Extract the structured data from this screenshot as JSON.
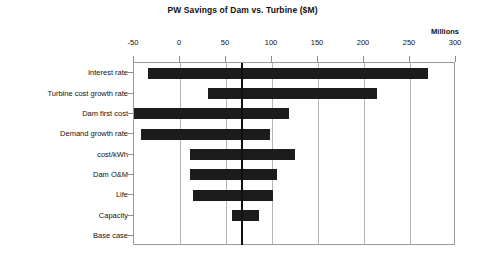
{
  "chart": {
    "title": "PW Savings of Dam vs. Turbine  ($M)",
    "units_label": "Millions"
  },
  "chart_data": {
    "type": "bar",
    "subtype": "tornado",
    "orientation": "horizontal",
    "title": "PW Savings of Dam vs. Turbine  ($M)",
    "xlabel": "Millions",
    "ylabel": "",
    "xlim": [
      -50,
      300
    ],
    "xticks": [
      -50,
      0,
      50,
      100,
      150,
      200,
      250,
      300
    ],
    "xtick_labels": [
      "-50",
      "0",
      "50",
      "100",
      "150",
      "200",
      "250",
      "300"
    ],
    "grid": true,
    "grid_axis": "x",
    "legend": false,
    "base_case_value": 67,
    "bar_color": "#1c1c1c",
    "categories": [
      "Interest rate",
      "Turbine cost growth rate",
      "Dam first cost",
      "Demand growth rate",
      "cost/kWh",
      "Dam O&M",
      "Life",
      "Capacity",
      "Base case"
    ],
    "low": [
      -35,
      30,
      -55,
      -42,
      11,
      11,
      14,
      57,
      67
    ],
    "high": [
      270,
      214,
      118,
      98,
      125,
      105,
      101,
      86,
      67
    ],
    "bars": [
      {
        "category": "Interest rate",
        "low": -35,
        "high": 270,
        "span": 305
      },
      {
        "category": "Turbine cost growth rate",
        "low": 30,
        "high": 214,
        "span": 184
      },
      {
        "category": "Dam first cost",
        "low": -55,
        "high": 118,
        "span": 173
      },
      {
        "category": "Demand growth rate",
        "low": -42,
        "high": 98,
        "span": 140
      },
      {
        "category": "cost/kWh",
        "low": 11,
        "high": 125,
        "span": 114
      },
      {
        "category": "Dam O&M",
        "low": 11,
        "high": 105,
        "span": 94
      },
      {
        "category": "Life",
        "low": 14,
        "high": 101,
        "span": 87
      },
      {
        "category": "Capacity",
        "low": 57,
        "high": 86,
        "span": 29
      },
      {
        "category": "Base case",
        "low": 67,
        "high": 67,
        "span": 0
      }
    ]
  }
}
